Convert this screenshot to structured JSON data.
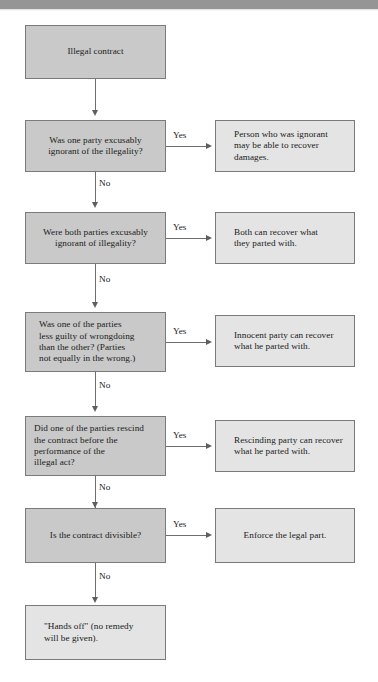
{
  "page": {
    "background_color": "#ffffff",
    "topbar_color": "#959595",
    "decision_box_color": "#c9c9c9",
    "outcome_box_color": "#e4e4e4",
    "connector_color": "#6e6e6e"
  },
  "labels": {
    "yes": "Yes",
    "no": "No"
  },
  "nodes": {
    "start": {
      "text": "Illegal contract"
    },
    "q1": {
      "text": "Was one party excusably\nignorant of the illegality?"
    },
    "a1": {
      "text": "Person who was ignorant\nmay be able to recover\ndamages."
    },
    "q2": {
      "text": "Were both parties excusably\nignorant of illegality?"
    },
    "a2": {
      "text": "Both can recover what\nthey parted with."
    },
    "q3": {
      "text": "Was one of the parties\nless guilty of wrongdoing\nthan the other?  (Parties\nnot equally in the wrong.)"
    },
    "a3": {
      "text": "Innocent party can recover\nwhat he parted with."
    },
    "q4": {
      "text": "Did one of the parties rescind\nthe contract before the\nperformance of the\nillegal act?"
    },
    "a4": {
      "text": "Rescinding party can recover\nwhat he parted with."
    },
    "q5": {
      "text": "Is the contract divisible?"
    },
    "a5": {
      "text": "Enforce the legal part."
    },
    "end": {
      "text": "\"Hands off\" (no remedy\nwill be given)."
    }
  },
  "edge_labels": {
    "q1_yes": "Yes",
    "q1_no": "No",
    "q2_yes": "Yes",
    "q2_no": "No",
    "q3_yes": "Yes",
    "q3_no": "No",
    "q4_yes": "Yes",
    "q4_no": "No",
    "q5_yes": "Yes",
    "q5_no": "No"
  }
}
